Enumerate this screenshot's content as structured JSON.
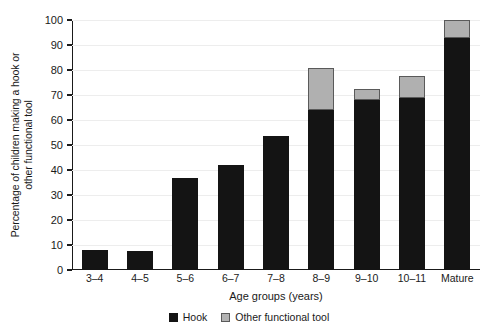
{
  "chart_data": {
    "type": "bar",
    "subtype": "stacked-bar",
    "title": "",
    "xlabel": "Age groups (years)",
    "ylabel": "Percentage of children making a hook or other functional tool",
    "ylabel_line1": "Percentage of children making a hook or",
    "ylabel_line2": "other functional tool",
    "categories": [
      "3–4",
      "4–5",
      "5–6",
      "6–7",
      "7–8",
      "8–9",
      "9–10",
      "10–11",
      "Mature"
    ],
    "series": [
      {
        "name": "Hook",
        "color": "#141414",
        "values": [
          8,
          7.5,
          37,
          42,
          53.5,
          64,
          68,
          69,
          93
        ]
      },
      {
        "name": "Other functional tool",
        "color": "#b3b3b3",
        "values": [
          0,
          0,
          0,
          0,
          0,
          17,
          4.5,
          8.5,
          7
        ]
      }
    ],
    "totals": [
      8,
      7.5,
      37,
      42,
      53.5,
      81,
      72.5,
      77.5,
      100
    ],
    "ylim": [
      0,
      100
    ],
    "yticks": [
      0,
      10,
      20,
      30,
      40,
      50,
      60,
      70,
      80,
      90,
      100
    ],
    "ytick_labels": [
      "0",
      "10",
      "20",
      "30",
      "40",
      "50",
      "60",
      "70",
      "80",
      "90",
      "100"
    ],
    "grid": "horizontal",
    "legend_position": "bottom-center",
    "legend": [
      {
        "label": "Hook",
        "swatch": "hook-swatch",
        "color": "#141414"
      },
      {
        "label": "Other functional tool",
        "swatch": "other-functional-tool-swatch",
        "color": "#b3b3b3"
      }
    ]
  }
}
